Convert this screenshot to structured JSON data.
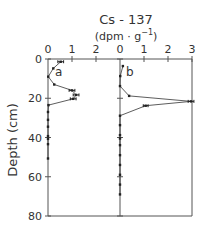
{
  "chart_data": {
    "type": "line",
    "title": "Cs - 137",
    "subtitle_prefix": "(dpm · g",
    "subtitle_sup": "−1",
    "subtitle_suffix": ")",
    "ylabel": "Depth (cm)",
    "xlabel": "",
    "ylim": [
      0,
      80
    ],
    "y_ticks": [
      0,
      20,
      40,
      60,
      80
    ],
    "y_tick_labels": [
      "0",
      "20",
      "40",
      "60",
      "80"
    ],
    "grid": false,
    "panels": [
      {
        "name": "a",
        "xlim": [
          0,
          3
        ],
        "x_ticks": [
          0,
          1,
          2
        ],
        "x_tick_labels": [
          "0",
          "1",
          "2"
        ],
        "points": [
          {
            "x": 0.53,
            "depth": 1.4,
            "err": 0.12
          },
          {
            "x": 0.22,
            "depth": 4.8,
            "err": 0
          },
          {
            "x": 0.01,
            "depth": 9,
            "err": 0
          },
          {
            "x": 0.26,
            "depth": 13,
            "err": 0
          },
          {
            "x": 1.0,
            "depth": 16,
            "err": 0.12
          },
          {
            "x": 1.17,
            "depth": 18.3,
            "err": 0.12
          },
          {
            "x": 1.05,
            "depth": 20.3,
            "err": 0.12
          },
          {
            "x": 0.02,
            "depth": 23.5,
            "err": 0
          },
          {
            "x": 0.0,
            "depth": 27,
            "err": 0
          },
          {
            "x": 0.0,
            "depth": 31,
            "err": 0
          },
          {
            "x": 0.0,
            "depth": 34.5,
            "err": 0
          },
          {
            "x": 0.0,
            "depth": 39.3,
            "err": 0
          },
          {
            "x": 0.0,
            "depth": 40.7,
            "err": 0
          },
          {
            "x": 0.0,
            "depth": 43.4,
            "err": 0
          },
          {
            "x": 0.0,
            "depth": 50.7,
            "err": 0
          }
        ]
      },
      {
        "name": "b",
        "xlim": [
          0,
          3
        ],
        "x_ticks": [
          0,
          1,
          2,
          3
        ],
        "x_tick_labels": [
          "0",
          "1",
          "2",
          "3"
        ],
        "points": [
          {
            "x": 0.12,
            "depth": 3.6,
            "err": 0
          },
          {
            "x": 0.01,
            "depth": 8.7,
            "err": 0
          },
          {
            "x": 0.0,
            "depth": 13.8,
            "err": 0
          },
          {
            "x": 0.38,
            "depth": 18.8,
            "err": 0
          },
          {
            "x": 2.96,
            "depth": 21.6,
            "err": 0.12
          },
          {
            "x": 1.07,
            "depth": 23.8,
            "err": 0.1
          },
          {
            "x": 0.0,
            "depth": 28.9,
            "err": 0
          },
          {
            "x": 0.0,
            "depth": 33.7,
            "err": 0
          },
          {
            "x": 0.0,
            "depth": 38.8,
            "err": 0
          },
          {
            "x": 0.0,
            "depth": 40.5,
            "err": 0
          },
          {
            "x": 0.0,
            "depth": 43.9,
            "err": 0
          },
          {
            "x": 0.0,
            "depth": 49,
            "err": 0
          },
          {
            "x": 0.0,
            "depth": 54,
            "err": 0
          },
          {
            "x": 0.0,
            "depth": 59,
            "err": 0
          },
          {
            "x": 0.0,
            "depth": 64,
            "err": 0
          },
          {
            "x": 0.0,
            "depth": 69,
            "err": 0
          }
        ]
      }
    ]
  },
  "colors": {
    "axis": "#555555",
    "line": "#333333",
    "marker": "#222222",
    "text": "#333333"
  }
}
